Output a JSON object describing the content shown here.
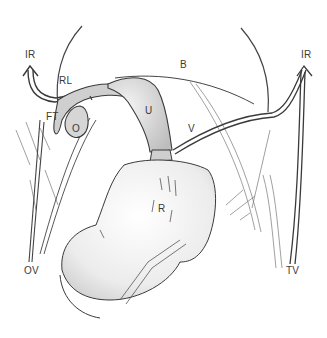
{
  "figure": {
    "type": "anatomical-line-drawing",
    "stroke_color": "#3a3a3a",
    "fill_color": "#d9d9d9",
    "labels": [
      {
        "id": "ir-left",
        "text": "IR",
        "x": 25,
        "y": 56
      },
      {
        "id": "rl",
        "text": "RL",
        "x": 59,
        "y": 81
      },
      {
        "id": "b",
        "text": "B",
        "x": 180,
        "y": 63
      },
      {
        "id": "ir-right",
        "text": "IR",
        "x": 301,
        "y": 56
      },
      {
        "id": "ft",
        "text": "FT",
        "x": 46,
        "y": 117
      },
      {
        "id": "o",
        "text": "O",
        "x": 70,
        "y": 128
      },
      {
        "id": "u",
        "text": "U",
        "x": 144,
        "y": 107
      },
      {
        "id": "v",
        "text": "V",
        "x": 187,
        "y": 126
      },
      {
        "id": "r",
        "text": "R",
        "x": 158,
        "y": 205
      },
      {
        "id": "ov",
        "text": "OV",
        "x": 24,
        "y": 268
      },
      {
        "id": "tv",
        "text": "TV",
        "x": 286,
        "y": 268
      }
    ]
  }
}
